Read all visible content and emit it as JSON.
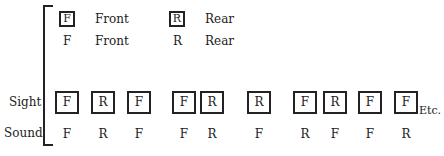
{
  "legend": [
    {
      "symbol": "F",
      "label": "Front",
      "boxed_label": "Front"
    },
    {
      "symbol": "R",
      "label": "Rear",
      "boxed_label": "Rear"
    }
  ],
  "rows": {
    "sight_label": "Sight",
    "sound_label": "Sound",
    "etc_label": "Etc."
  },
  "sight": [
    "F",
    "R",
    "F",
    "F",
    "R",
    "R",
    "F",
    "R",
    "F",
    "F"
  ],
  "sound": [
    "F",
    "R",
    "F",
    "F",
    "R",
    "F",
    "R",
    "F",
    "F",
    "R"
  ]
}
